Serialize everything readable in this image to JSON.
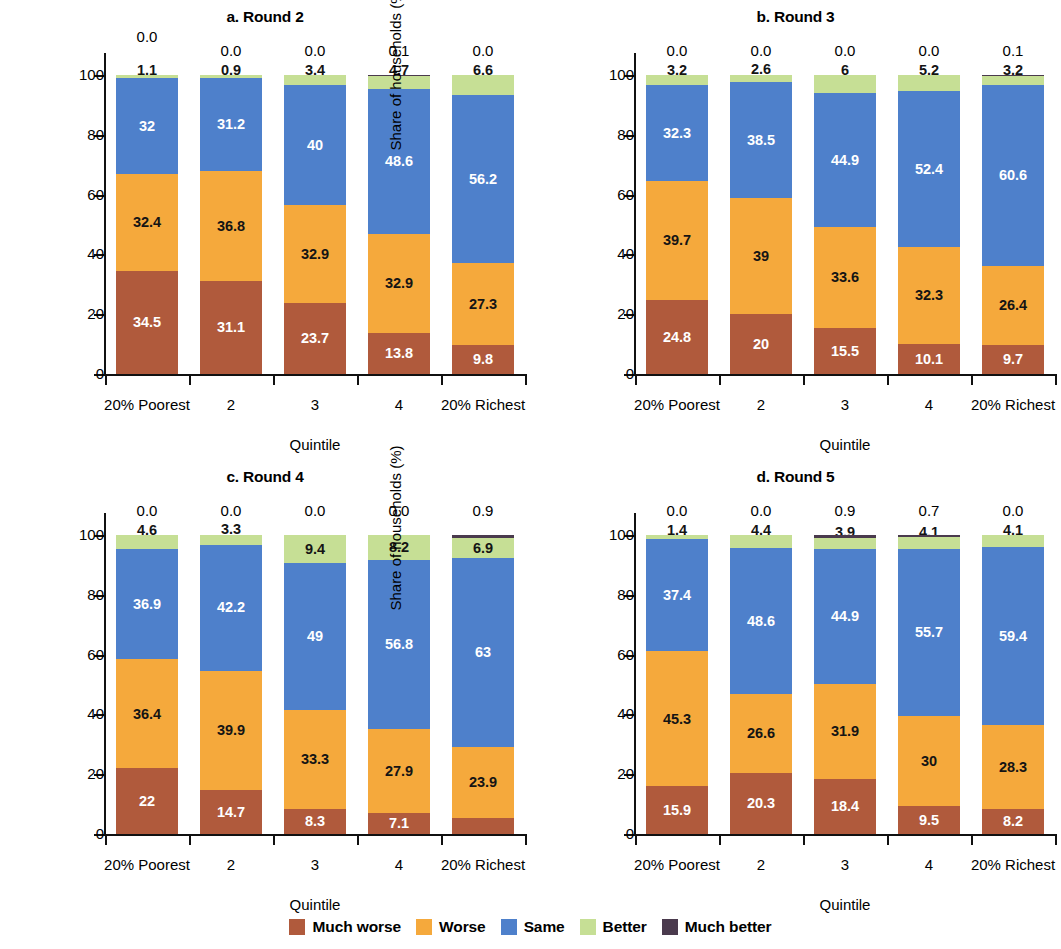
{
  "chart_data": {
    "type": "bar",
    "subtype": "stacked-bar-100",
    "title": "",
    "xlabel": "Quintile",
    "ylabel": "Share of households (%)",
    "ylim": [
      0,
      100
    ],
    "yticks": [
      "0",
      "20",
      "40",
      "60",
      "80",
      "100"
    ],
    "grid": false,
    "legend_position": "bottom",
    "categories": [
      "20% Poorest",
      "2",
      "3",
      "4",
      "20% Richest"
    ],
    "series_names": [
      "Much worse",
      "Worse",
      "Same",
      "Better",
      "Much better"
    ],
    "colors": {
      "much_worse": "#B05A3C",
      "worse": "#F5A93C",
      "same": "#4E80CB",
      "better": "#C6DF95",
      "much_better": "#4A3A4D"
    },
    "panels": [
      {
        "key": "a",
        "title": "a. Round 2",
        "ylabel": "Share of households (%)",
        "xlabel": "Quintile",
        "series": [
          {
            "name": "Much worse",
            "values": [
              34.5,
              31.1,
              23.7,
              13.8,
              9.8
            ]
          },
          {
            "name": "Worse",
            "values": [
              32.4,
              36.8,
              32.9,
              32.9,
              27.3
            ]
          },
          {
            "name": "Same",
            "values": [
              32.0,
              31.2,
              40.0,
              48.6,
              56.2
            ]
          },
          {
            "name": "Better",
            "values": [
              1.1,
              0.9,
              3.4,
              4.7,
              6.6
            ]
          },
          {
            "name": "Much better",
            "values": [
              0.0,
              0.0,
              0.0,
              0.1,
              0.0
            ]
          }
        ],
        "top_annotations": [
          "0.0",
          "0.0",
          "0.0",
          "0.1",
          "0.0"
        ]
      },
      {
        "key": "b",
        "title": "b. Round 3",
        "ylabel": "Share of households (%)",
        "xlabel": "Quintile",
        "series": [
          {
            "name": "Much worse",
            "values": [
              24.8,
              20.0,
              15.5,
              10.1,
              9.7
            ]
          },
          {
            "name": "Worse",
            "values": [
              39.7,
              39.0,
              33.6,
              32.3,
              26.4
            ]
          },
          {
            "name": "Same",
            "values": [
              32.3,
              38.5,
              44.9,
              52.4,
              60.6
            ]
          },
          {
            "name": "Better",
            "values": [
              3.2,
              2.6,
              6.0,
              5.2,
              3.2
            ]
          },
          {
            "name": "Much better",
            "values": [
              0.0,
              0.0,
              0.0,
              0.0,
              0.1
            ]
          }
        ],
        "top_annotations": [
          "0.0",
          "0.0",
          "0.0",
          "0.0",
          "0.1"
        ]
      },
      {
        "key": "c",
        "title": "c. Round 4",
        "ylabel": "Share of households(%)",
        "xlabel": "Quintile",
        "series": [
          {
            "name": "Much worse",
            "values": [
              22.0,
              14.7,
              8.3,
              7.1,
              5.3
            ]
          },
          {
            "name": "Worse",
            "values": [
              36.4,
              39.9,
              33.3,
              27.9,
              23.9
            ]
          },
          {
            "name": "Same",
            "values": [
              36.9,
              42.2,
              49.0,
              56.8,
              63.0
            ]
          },
          {
            "name": "Better",
            "values": [
              4.6,
              3.3,
              9.4,
              8.2,
              6.9
            ]
          },
          {
            "name": "Much better",
            "values": [
              0.0,
              0.0,
              0.0,
              0.0,
              0.9
            ]
          }
        ],
        "top_annotations": [
          "0.0",
          "0.0",
          "0.0",
          "0.0",
          "0.9"
        ]
      },
      {
        "key": "d",
        "title": "d. Round 5",
        "ylabel": "Share of households (%)",
        "xlabel": "Quintile",
        "series": [
          {
            "name": "Much worse",
            "values": [
              15.9,
              20.3,
              18.4,
              9.5,
              8.2
            ]
          },
          {
            "name": "Worse",
            "values": [
              45.3,
              26.6,
              31.9,
              30.0,
              28.3
            ]
          },
          {
            "name": "Same",
            "values": [
              37.4,
              48.6,
              44.9,
              55.7,
              59.4
            ]
          },
          {
            "name": "Better",
            "values": [
              1.4,
              4.4,
              3.9,
              4.1,
              4.1
            ]
          },
          {
            "name": "Much better",
            "values": [
              0.0,
              0.0,
              0.9,
              0.7,
              0.0
            ]
          }
        ],
        "top_annotations": [
          "0.0",
          "0.0",
          "0.9",
          "0.7",
          "0.0"
        ]
      }
    ]
  },
  "legend": {
    "items": [
      {
        "label": "Much worse",
        "color": "#B05A3C"
      },
      {
        "label": "Worse",
        "color": "#F5A93C"
      },
      {
        "label": "Same",
        "color": "#4E80CB"
      },
      {
        "label": "Better",
        "color": "#C6DF95"
      },
      {
        "label": "Much better",
        "color": "#4A3A4D"
      }
    ]
  }
}
